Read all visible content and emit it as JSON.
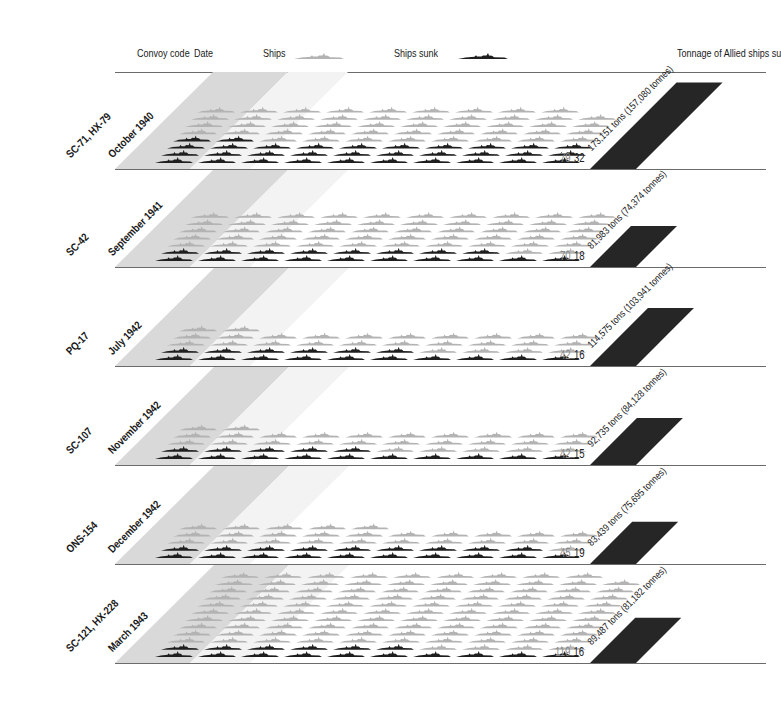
{
  "chart_data": {
    "type": "pictogram",
    "title": "",
    "headers": {
      "convoy_code": "Convoy code",
      "date": "Date",
      "ships": "Ships",
      "ships_sunk": "Ships sunk",
      "tonnage": "Tonnage of Allied ships su"
    },
    "colors": {
      "ship": "#b3b3b3",
      "ship_sunk": "#1e1e1e",
      "band": "#d9d9d9",
      "tonnage_bar": "#262626"
    },
    "convoys": [
      {
        "code": "SC-71, HX-79",
        "date": "October 1940",
        "ships": 79,
        "sunk": 32,
        "tonnage": "173,151 tons (157,080 tonnes)",
        "tons": 173151,
        "tonnes": 157080
      },
      {
        "code": "SC-42",
        "date": "September 1941",
        "ships": 70,
        "sunk": 18,
        "tonnage": "81,983 tons (74,374 tonnes)",
        "tons": 81983,
        "tonnes": 74374
      },
      {
        "code": "PQ-17",
        "date": "July 1942",
        "ships": 42,
        "sunk": 16,
        "tonnage": "114,575 tons (103,941 tonnes)",
        "tons": 114575,
        "tonnes": 103941
      },
      {
        "code": "SC-107",
        "date": "November 1942",
        "ships": 42,
        "sunk": 15,
        "tonnage": "92,735 tons (84,128 tonnes)",
        "tons": 92735,
        "tonnes": 84128
      },
      {
        "code": "ONS-154",
        "date": "December 1942",
        "ships": 45,
        "sunk": 19,
        "tonnage": "83,439 tons (75,695 tonnes)",
        "tons": 83439,
        "tonnes": 75695
      },
      {
        "code": "SC-121, HX-228",
        "date": "March 1943",
        "ships": 119,
        "sunk": 16,
        "tonnage": "89,487 tons (81,182 tonnes)",
        "tons": 89487,
        "tonnes": 81182
      }
    ]
  }
}
